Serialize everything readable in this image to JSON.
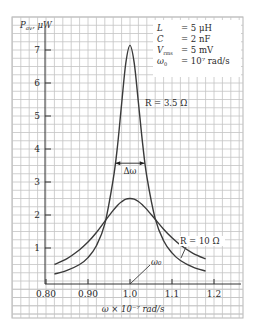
{
  "chart_data": {
    "type": "line",
    "title": "",
    "xlabel": "ω × 10⁻⁷ rad/s",
    "ylabel": "P_av, μW",
    "ylabel_main": "P",
    "ylabel_sub": "av",
    "ylabel_unit": ", μW",
    "xlim": [
      0.8,
      1.25
    ],
    "ylim": [
      0,
      7.5
    ],
    "grid": true,
    "x_ticks": [
      0.8,
      0.9,
      1.0,
      1.1,
      1.2
    ],
    "x_tick_labels": [
      "0.80",
      "0.90",
      "1.0",
      "1.1",
      "1.2"
    ],
    "y_ticks": [
      1,
      2,
      3,
      4,
      5,
      6,
      7
    ],
    "y_tick_labels": [
      "1",
      "2",
      "3",
      "4",
      "5",
      "6",
      "7"
    ],
    "x": [
      0.82,
      0.85,
      0.88,
      0.9,
      0.92,
      0.94,
      0.96,
      0.97,
      0.98,
      0.99,
      1.0,
      1.01,
      1.02,
      1.03,
      1.04,
      1.06,
      1.08,
      1.1,
      1.12,
      1.15,
      1.18
    ],
    "series": [
      {
        "name": "R = 3.5 Ω",
        "values": [
          0.21,
          0.32,
          0.5,
          0.71,
          1.07,
          1.73,
          3.08,
          4.06,
          5.36,
          6.6,
          7.14,
          6.61,
          5.41,
          4.17,
          3.17,
          1.89,
          1.22,
          0.85,
          0.62,
          0.42,
          0.3
        ]
      },
      {
        "name": "R = 10 Ω",
        "values": [
          0.5,
          0.68,
          0.95,
          1.18,
          1.47,
          1.81,
          2.14,
          2.29,
          2.4,
          2.48,
          2.5,
          2.48,
          2.41,
          2.3,
          2.17,
          1.87,
          1.57,
          1.31,
          1.09,
          0.84,
          0.67
        ]
      }
    ],
    "annotations": {
      "r_small": "R = 3.5 Ω",
      "r_large": "R = 10 Ω",
      "bandwidth": "Δω",
      "bandwidth_range": [
        0.965,
        1.035
      ],
      "bandwidth_level": 3.57,
      "resonance": "ω₀",
      "resonance_x": 1.0
    },
    "parameters": [
      {
        "name": "L",
        "value": "= 5 μH"
      },
      {
        "name": "C",
        "value": "= 2 nF"
      },
      {
        "name": "V",
        "sub": "rms",
        "value": "= 5 mV"
      },
      {
        "name": "ω",
        "sub": "0",
        "value": "= 10⁷ rad/s"
      }
    ]
  }
}
